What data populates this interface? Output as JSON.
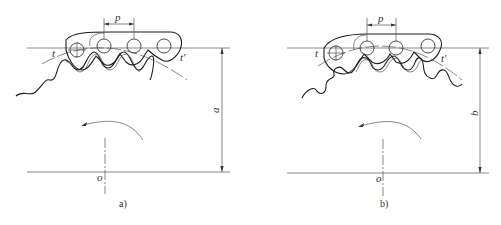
{
  "figure": {
    "panels": [
      {
        "id": "a",
        "caption": "a)",
        "labels": {
          "pitch": "p",
          "left_point": "t",
          "right_point": "t'",
          "center": "o",
          "distance": "a"
        },
        "description": "Roller chain engaging sprocket, pitch line at distance a from center o"
      },
      {
        "id": "b",
        "caption": "b)",
        "labels": {
          "pitch": "p",
          "left_point": "t",
          "right_point": "t'",
          "center": "o",
          "distance": "b"
        },
        "description": "Roller chain engaging sprocket, pitch line at distance b from center o"
      }
    ],
    "colors": {
      "line": "#3a3a3a",
      "background": "#ffffff"
    }
  }
}
